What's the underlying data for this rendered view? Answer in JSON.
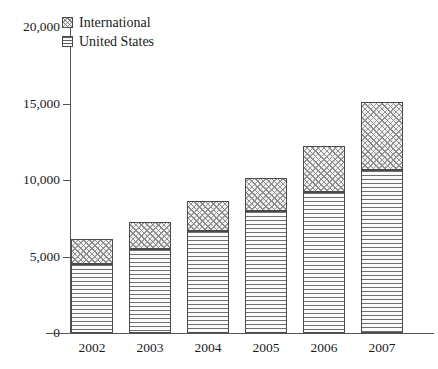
{
  "chart_data": {
    "type": "bar",
    "subtype": "stacked-vertical",
    "title": "",
    "xlabel": "",
    "ylabel": "",
    "categories": [
      "2002",
      "2003",
      "2004",
      "2005",
      "2006",
      "2007"
    ],
    "series": [
      {
        "name": "United States",
        "values": [
          4500,
          5500,
          6700,
          7950,
          9200,
          10650
        ]
      },
      {
        "name": "International",
        "values": [
          1650,
          1750,
          1900,
          2200,
          3000,
          4450
        ]
      }
    ],
    "totals": [
      6150,
      7250,
      8600,
      10150,
      12200,
      15100
    ],
    "ylim": [
      0,
      20000
    ],
    "yticks": [
      0,
      5000,
      10000,
      15000,
      20000
    ],
    "ytick_labels": [
      "0",
      "5,000",
      "10,000",
      "15,000",
      "20,000"
    ],
    "grid": false,
    "legend_position": "top-left",
    "legend_entries": [
      {
        "label": "International",
        "pattern": "diagonal-crosshatch"
      },
      {
        "label": "United States",
        "pattern": "horizontal-lines"
      }
    ]
  }
}
